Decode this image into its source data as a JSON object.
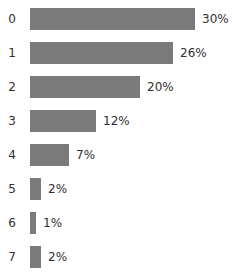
{
  "chart_data": {
    "type": "bar",
    "orientation": "horizontal",
    "title": "",
    "subtitle": "",
    "xlabel": "",
    "ylabel": "",
    "grid": false,
    "legend": null,
    "legend_position": "none",
    "axis_visible": false,
    "xlim": [
      0,
      30
    ],
    "categories": [
      "0",
      "1",
      "2",
      "3",
      "4",
      "5",
      "6",
      "7"
    ],
    "values": [
      30,
      26,
      20,
      12,
      7,
      2,
      1,
      2
    ],
    "value_labels": [
      "30%",
      "26%",
      "20%",
      "12%",
      "7%",
      "2%",
      "1%",
      "2%"
    ],
    "bar_color": "#7a7a7a",
    "background_color": "#ffffff",
    "text_color": "#2f2f2f",
    "bars": [
      {
        "category": "0",
        "value": 30,
        "label": "30%"
      },
      {
        "category": "1",
        "value": 26,
        "label": "26%"
      },
      {
        "category": "2",
        "value": 20,
        "label": "20%"
      },
      {
        "category": "3",
        "value": 12,
        "label": "12%"
      },
      {
        "category": "4",
        "value": 7,
        "label": "7%"
      },
      {
        "category": "5",
        "value": 2,
        "label": "2%"
      },
      {
        "category": "6",
        "value": 1,
        "label": "1%"
      },
      {
        "category": "7",
        "value": 2,
        "label": "2%"
      }
    ]
  }
}
